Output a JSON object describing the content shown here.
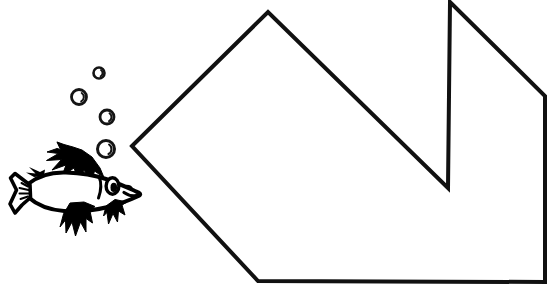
{
  "document": {
    "title": "Fish and Bubbles Line Art",
    "description": "Black and white coloring-book style line drawing of a fish blowing bubbles toward a large notched polygon outline",
    "width": 547,
    "height": 287,
    "background_color": "#ffffff",
    "ink_color": "#000000",
    "style": "line-art"
  },
  "artwork": {
    "polygon": {
      "name": "notched-polygon",
      "stroke_color": "#111111",
      "fill_color": "#ffffff",
      "stroke_width": 4,
      "vertices": [
        [
          132,
          146
        ],
        [
          268,
          12
        ],
        [
          448,
          188
        ],
        [
          450,
          2
        ],
        [
          545,
          96
        ],
        [
          545,
          282
        ],
        [
          258,
          281
        ]
      ],
      "vertex_count": 7
    },
    "fish": {
      "name": "fish",
      "body_color": "#ffffff",
      "outline_color": "#000000",
      "fin_color": "#000000",
      "bounding_box": [
        8,
        140,
        140,
        115
      ],
      "facing": "right",
      "parts": [
        "tail-fin",
        "dorsal-fin",
        "body",
        "pectoral-fin",
        "ventral-fin-front",
        "ventral-fin-rear",
        "eye",
        "snout"
      ]
    },
    "bubbles": {
      "name": "bubble-trail",
      "count": 4,
      "stroke_color": "#000000",
      "items": [
        {
          "cx": 99,
          "cy": 73,
          "r": 5.5
        },
        {
          "cx": 79,
          "cy": 97,
          "r": 7.5
        },
        {
          "cx": 107,
          "cy": 117,
          "r": 7.0
        },
        {
          "cx": 106,
          "cy": 149,
          "r": 8.5
        }
      ]
    }
  }
}
